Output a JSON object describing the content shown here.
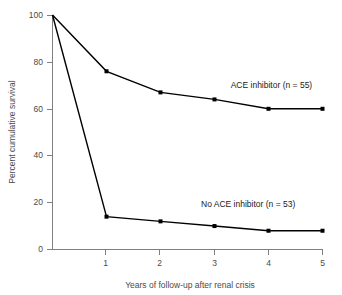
{
  "chart_data": {
    "type": "line",
    "title": "",
    "subtitle": "",
    "xlabel": "Years of follow-up after renal crisis",
    "ylabel": "Percent cumulative survival",
    "x": [
      0,
      1,
      2,
      3,
      4,
      5
    ],
    "xlim": [
      0,
      5
    ],
    "ylim": [
      0,
      100
    ],
    "xticks": [
      0,
      1,
      2,
      3,
      4,
      5
    ],
    "xtick_labels": [
      "",
      "1",
      "2",
      "3",
      "4",
      "5"
    ],
    "yticks": [
      0,
      20,
      40,
      60,
      80,
      100
    ],
    "ytick_labels": [
      "0",
      "20",
      "40",
      "60",
      "80",
      "100"
    ],
    "grid": false,
    "legend_position": "inline-right",
    "marker": "square",
    "series": [
      {
        "name": "ACE inhibitor (n = 55)",
        "values": [
          100,
          76,
          67,
          64,
          60,
          60
        ],
        "color": "#000000",
        "annotation": "ACE inhibitor (n = 55)",
        "annotation_x": 3.3,
        "annotation_y": 69
      },
      {
        "name": "No ACE inhibitor (n = 53)",
        "values": [
          100,
          14,
          12,
          10,
          8,
          8
        ],
        "color": "#000000",
        "annotation": "No ACE inhibitor (n = 53)",
        "annotation_x": 2.75,
        "annotation_y": 18
      }
    ]
  },
  "axes": {
    "y_title": "Percent cumulative survival",
    "x_title": "Years of follow-up after renal crisis",
    "axis_color": "#808080",
    "tick_label_color": "#4a4a4a"
  },
  "annotations": {
    "ace": "ACE inhibitor (n = 55)",
    "no_ace": "No ACE inhibitor (n = 53)"
  },
  "ticks": {
    "y": [
      "100",
      "80",
      "60",
      "40",
      "20",
      "0"
    ],
    "x": [
      "1",
      "2",
      "3",
      "4",
      "5"
    ]
  }
}
